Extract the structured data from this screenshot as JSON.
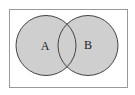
{
  "diagram": {
    "type": "venn",
    "shaded_region": "A union B",
    "sets": [
      {
        "label": "A"
      },
      {
        "label": "B"
      }
    ],
    "colors": {
      "fill": "#cfcfcf",
      "stroke": "#444444",
      "border": "#888888"
    }
  }
}
